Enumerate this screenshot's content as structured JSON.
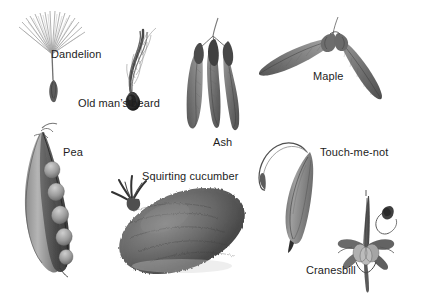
{
  "plate": {
    "title": "Seed and fruit dispersal specimens",
    "background_color": "#ffffff",
    "ink_color": "#1d1d1d",
    "width": 426,
    "height": 302
  },
  "specimens": [
    {
      "id": "dandelion",
      "label": "Dandelion",
      "icon": "dandelion-pappus-seed",
      "dispersal": "wind",
      "label_position": {
        "x": 51,
        "y": 48
      }
    },
    {
      "id": "old-mans-beard",
      "label": "Old man’s beard",
      "icon": "plumed-achene-seed",
      "dispersal": "wind",
      "label_position": {
        "x": 78,
        "y": 97
      }
    },
    {
      "id": "ash",
      "label": "Ash",
      "icon": "ash-samara-cluster",
      "dispersal": "wind",
      "label_position": {
        "x": 213,
        "y": 136
      }
    },
    {
      "id": "maple",
      "label": "Maple",
      "icon": "maple-double-samara",
      "dispersal": "wind",
      "label_position": {
        "x": 313,
        "y": 70
      }
    },
    {
      "id": "pea",
      "label": "Pea",
      "icon": "split-pea-pod",
      "dispersal": "explosive",
      "label_position": {
        "x": 63,
        "y": 146
      }
    },
    {
      "id": "squirting-cucumber",
      "label": "Squirting cucumber",
      "icon": "bristly-ovoid-fruit",
      "dispersal": "explosive",
      "label_position": {
        "x": 142,
        "y": 170
      }
    },
    {
      "id": "touch-me-not",
      "label": "Touch-me-not",
      "icon": "curled-dehiscent-pod",
      "dispersal": "explosive",
      "label_position": {
        "x": 320,
        "y": 146
      }
    },
    {
      "id": "cranesbill",
      "label": "Cranesbill",
      "icon": "beaked-capsule-with-coiled-awn",
      "dispersal": "explosive",
      "label_position": {
        "x": 306,
        "y": 264
      }
    }
  ]
}
